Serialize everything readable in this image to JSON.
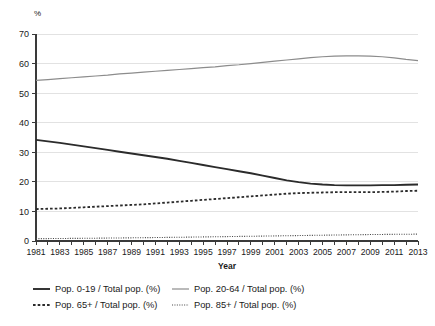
{
  "chart_data": {
    "type": "line",
    "title": "",
    "xlabel": "Year",
    "ylabel": "%",
    "ylim": [
      0,
      70
    ],
    "xlim": [
      1981,
      2013
    ],
    "grid": true,
    "legend_position": "bottom",
    "yticks": [
      0,
      10,
      20,
      30,
      40,
      50,
      60,
      70
    ],
    "xticks": [
      1981,
      1983,
      1985,
      1987,
      1989,
      1991,
      1993,
      1995,
      1997,
      1999,
      2001,
      2003,
      2005,
      2007,
      2009,
      2011,
      2013
    ],
    "x": [
      1981,
      1982,
      1983,
      1984,
      1985,
      1986,
      1987,
      1988,
      1989,
      1990,
      1991,
      1992,
      1993,
      1994,
      1995,
      1996,
      1997,
      1998,
      1999,
      2000,
      2001,
      2002,
      2003,
      2004,
      2005,
      2006,
      2007,
      2008,
      2009,
      2010,
      2011,
      2012,
      2013
    ],
    "series": [
      {
        "name": "Pop. 0-19 / Total pop. (%)",
        "style": "solid",
        "color": "#2b2b2b",
        "width": 1.9,
        "values": [
          34.2,
          33.7,
          33.2,
          32.6,
          32.0,
          31.4,
          30.8,
          30.2,
          29.6,
          29.0,
          28.4,
          27.8,
          27.1,
          26.4,
          25.7,
          25.0,
          24.3,
          23.6,
          22.9,
          22.1,
          21.3,
          20.5,
          19.9,
          19.4,
          19.1,
          18.9,
          18.8,
          18.8,
          18.8,
          18.9,
          18.9,
          19.0,
          19.1
        ]
      },
      {
        "name": "Pop. 20-64 / Total pop. (%)",
        "style": "solid",
        "color": "#8c8c8c",
        "width": 1.2,
        "values": [
          54.3,
          54.6,
          54.9,
          55.2,
          55.5,
          55.8,
          56.1,
          56.5,
          56.8,
          57.1,
          57.4,
          57.7,
          58.0,
          58.3,
          58.6,
          58.9,
          59.3,
          59.6,
          60.0,
          60.4,
          60.8,
          61.2,
          61.6,
          62.0,
          62.3,
          62.5,
          62.6,
          62.6,
          62.5,
          62.3,
          61.9,
          61.4,
          61.0
        ]
      },
      {
        "name": "Pop. 65+ / Total pop. (%)",
        "style": "dotted-coarse",
        "color": "#2b2b2b",
        "width": 1.8,
        "values": [
          10.8,
          10.9,
          11.0,
          11.2,
          11.4,
          11.6,
          11.8,
          12.0,
          12.2,
          12.4,
          12.7,
          13.0,
          13.3,
          13.6,
          13.9,
          14.2,
          14.5,
          14.8,
          15.1,
          15.4,
          15.7,
          16.0,
          16.2,
          16.3,
          16.4,
          16.5,
          16.5,
          16.5,
          16.5,
          16.6,
          16.7,
          16.9,
          17.0
        ]
      },
      {
        "name": "Pop. 85+ / Total pop. (%)",
        "style": "dotted-fine",
        "color": "#4a4a4a",
        "width": 1.1,
        "values": [
          0.8,
          0.82,
          0.85,
          0.88,
          0.91,
          0.95,
          0.99,
          1.03,
          1.07,
          1.12,
          1.17,
          1.22,
          1.27,
          1.32,
          1.38,
          1.43,
          1.49,
          1.55,
          1.6,
          1.66,
          1.72,
          1.78,
          1.84,
          1.9,
          1.96,
          2.02,
          2.08,
          2.13,
          2.18,
          2.22,
          2.26,
          2.29,
          2.32
        ]
      }
    ]
  },
  "legend": {
    "entries": [
      {
        "label": "Pop. 0-19 / Total pop. (%)"
      },
      {
        "label": "Pop. 20-64 / Total pop. (%)"
      },
      {
        "label": "Pop. 65+ / Total pop. (%)"
      },
      {
        "label": "Pop. 85+ / Total pop. (%)"
      }
    ]
  },
  "axes": {
    "y_unit": "%",
    "x_title": "Year"
  }
}
